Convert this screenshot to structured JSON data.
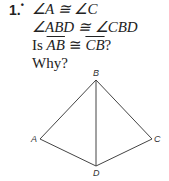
{
  "problem": {
    "number": "1.",
    "marker": "•",
    "given1": "∠A ≅ ∠C",
    "given2": "∠ABD ≅ ∠CBD",
    "question_prefix": "Is ",
    "seg1": "AB",
    "congruent": " ≅ ",
    "seg2": "CB",
    "question_suffix": "?",
    "why": "Why?"
  },
  "figure": {
    "vertices": {
      "A": {
        "label": "A",
        "x": 40,
        "y": 139
      },
      "B": {
        "label": "B",
        "x": 96,
        "y": 79
      },
      "C": {
        "label": "C",
        "x": 152,
        "y": 139
      },
      "D": {
        "label": "D",
        "x": 96,
        "y": 166
      }
    },
    "segments": [
      "AB",
      "BC",
      "CD",
      "DA",
      "BD"
    ],
    "stroke_color": "#444444"
  }
}
